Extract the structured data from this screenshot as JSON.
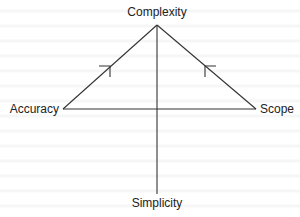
{
  "diagram": {
    "type": "triangle-tradeoff",
    "nodes": {
      "top": "Complexity",
      "left": "Accuracy",
      "right": "Scope",
      "bottom": "Simplicity"
    },
    "edges": [
      {
        "from": "Accuracy",
        "to": "Complexity",
        "arrow": "toward Complexity"
      },
      {
        "from": "Scope",
        "to": "Complexity",
        "arrow": "toward Complexity"
      },
      {
        "from": "Accuracy",
        "to": "Scope",
        "arrow": "none"
      },
      {
        "from": "Complexity",
        "to": "Simplicity",
        "arrow": "none"
      }
    ],
    "colors": {
      "line": "#333333",
      "text": "#222222",
      "background": "#ffffff"
    }
  }
}
